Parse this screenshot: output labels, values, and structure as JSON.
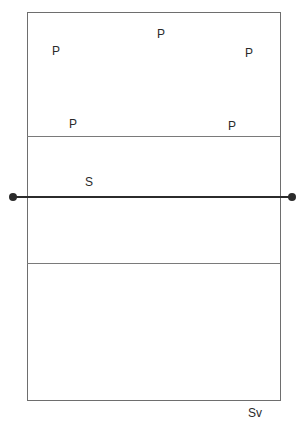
{
  "diagram": {
    "colors": {
      "court_line": "#6e6e6e",
      "net": "#2b2b2b",
      "text": "#2a2a2a",
      "background": "#ffffff"
    },
    "players": [
      {
        "label": "P",
        "x": 52,
        "y": 45
      },
      {
        "label": "P",
        "x": 157,
        "y": 28
      },
      {
        "label": "P",
        "x": 245,
        "y": 47
      },
      {
        "label": "P",
        "x": 69,
        "y": 118
      },
      {
        "label": "P",
        "x": 228,
        "y": 120
      }
    ],
    "setter": {
      "label": "S",
      "x": 85,
      "y": 176
    },
    "server": {
      "label": "Sv",
      "x": 248,
      "y": 407
    }
  }
}
